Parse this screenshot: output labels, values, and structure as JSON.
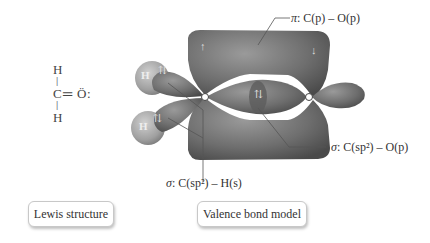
{
  "lewis": {
    "title": "Lewis structure",
    "atoms": {
      "h_top": "H",
      "carbon": "C",
      "double_bond": "═",
      "oxygen": "Ö",
      "lone_pair": ":",
      "h_bottom": "H"
    },
    "bond_top": "|",
    "bond_bottom": "|"
  },
  "vb": {
    "title": "Valence bond model",
    "pi_label": {
      "sym": "π",
      "text": ": C(p) – O(p)"
    },
    "sigma_co_label": {
      "sym": "σ",
      "text": ": C(sp²) – O(p)"
    },
    "sigma_ch_label": {
      "sym": "σ",
      "text": ": C(sp²) – H(s)"
    },
    "electron_pairs": [
      "⇅",
      "⇅",
      "⇅"
    ],
    "pi_electrons": [
      "↑",
      "↓"
    ],
    "h_labels": [
      "H",
      "H"
    ]
  },
  "colors": {
    "lobe": "#6e6e6e",
    "lobe_dark": "#585858",
    "h_sphere": "#a9a9a9",
    "background": "#ffffff",
    "leader_line": "#555555"
  }
}
